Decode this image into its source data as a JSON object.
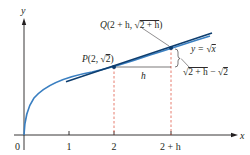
{
  "figure": {
    "axes": {
      "x_label": "x",
      "y_label": "y",
      "origin_label": "0",
      "ticks": [
        {
          "label": "1",
          "x": 69
        },
        {
          "label": "2",
          "x": 114
        },
        {
          "label": "2 + h",
          "x": 171
        }
      ]
    },
    "curve": {
      "label_prefix": "y = ",
      "label_root": "√",
      "label_arg": "x"
    },
    "point_p": {
      "name": "P",
      "coord_open": "(2, ",
      "root": "√",
      "root_arg": "2",
      "coord_close": ")"
    },
    "point_q": {
      "name": "Q",
      "coord_open": "(2 + h, ",
      "root": "√",
      "root_arg": "2 + h",
      "coord_close": ")"
    },
    "h_label": "h",
    "rise_label": {
      "root1": "√",
      "arg1": "2 + h",
      "minus": " − ",
      "root2": "√",
      "arg2": "2"
    },
    "colors": {
      "curve": "#3a7fc1",
      "secant": "#0d3d6e",
      "dashed": "#e05a4a",
      "axis": "#231f20",
      "point": "#0d3d6e"
    }
  }
}
